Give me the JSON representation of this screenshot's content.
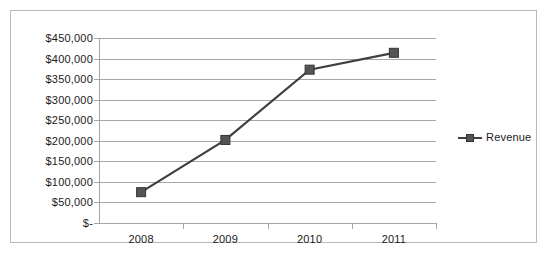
{
  "chart_data": {
    "type": "line",
    "title": "",
    "xlabel": "",
    "ylabel": "",
    "categories": [
      "2008",
      "2009",
      "2010",
      "2011"
    ],
    "series": [
      {
        "name": "Revenue",
        "values": [
          75000,
          202000,
          373000,
          414000
        ],
        "color": "#3f3f3f",
        "marker": "square",
        "marker_color": "#555555"
      }
    ],
    "ylim": [
      0,
      450000
    ],
    "ytick_values": [
      450000,
      400000,
      350000,
      300000,
      250000,
      200000,
      150000,
      100000,
      50000,
      0
    ],
    "ytick_labels": [
      "$450,000",
      "$400,000",
      "$350,000",
      "$300,000",
      "$250,000",
      "$200,000",
      "$150,000",
      "$100,000",
      "$50,000",
      "$-"
    ],
    "grid": true,
    "grid_color": "#a6a6a6",
    "legend": {
      "position": "right",
      "entries": [
        "Revenue"
      ]
    },
    "plot_background": "#ffffff",
    "frame_border_color": "#b9b9b9"
  }
}
